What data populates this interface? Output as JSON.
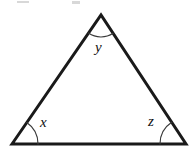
{
  "figure": {
    "type": "triangle-angle-diagram",
    "background_color": "#ffffff",
    "stroke_color": "#1a1a1a",
    "stroke_width": 3,
    "arc_color": "#3a3a3a",
    "arc_width": 1.2,
    "vertices": {
      "apex": {
        "name": "apex-vertex",
        "x": 101,
        "y": 15
      },
      "bottom_left": {
        "name": "bottom-left-vertex",
        "x": 12,
        "y": 144
      },
      "bottom_right": {
        "name": "bottom-right-vertex",
        "x": 186,
        "y": 144
      }
    },
    "edges": [
      {
        "name": "left-edge",
        "from": "bottom_left",
        "to": "apex"
      },
      {
        "name": "right-edge",
        "from": "apex",
        "to": "bottom_right"
      },
      {
        "name": "base-edge",
        "from": "bottom_left",
        "to": "bottom_right"
      }
    ],
    "angles": [
      {
        "name": "angle-x",
        "label": "x",
        "vertex": "bottom_left",
        "arc_radius": 26,
        "label_x": 40,
        "label_y": 115
      },
      {
        "name": "angle-y",
        "label": "y",
        "vertex": "apex",
        "arc_radius": 22,
        "label_x": 95,
        "label_y": 40
      },
      {
        "name": "angle-z",
        "label": "z",
        "vertex": "bottom_right",
        "arc_radius": 26,
        "label_x": 148,
        "label_y": 114
      }
    ],
    "artifacts": [
      {
        "name": "top-crop-artifact-left",
        "x": 17,
        "y": 1,
        "width": 12,
        "height": 2
      },
      {
        "name": "top-crop-artifact-right",
        "x": 72,
        "y": 1,
        "width": 8,
        "height": 3
      }
    ]
  }
}
